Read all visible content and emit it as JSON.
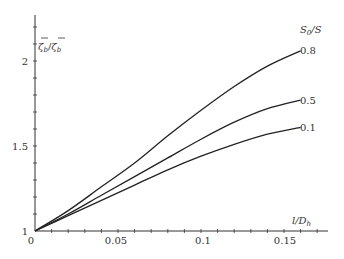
{
  "chart_data": {
    "type": "line",
    "title": "",
    "xlabel": "l/D_h",
    "ylabel": "ζ_b/ζ_b",
    "legend_title": "S_0/S",
    "xlim": [
      0,
      0.175
    ],
    "ylim": [
      1,
      2.25
    ],
    "x_ticks": [
      "0",
      "0.05",
      "0.1",
      "0.15"
    ],
    "y_ticks": [
      "1",
      "1.5",
      "2"
    ],
    "grid": false,
    "x": [
      0,
      0.02,
      0.04,
      0.06,
      0.08,
      0.1,
      0.12,
      0.14,
      0.16
    ],
    "series": [
      {
        "name": "0.8",
        "values": [
          1.0,
          1.12,
          1.26,
          1.4,
          1.56,
          1.71,
          1.85,
          1.97,
          2.06
        ]
      },
      {
        "name": "0.5",
        "values": [
          1.0,
          1.1,
          1.21,
          1.32,
          1.43,
          1.54,
          1.64,
          1.72,
          1.77
        ]
      },
      {
        "name": "0.1",
        "values": [
          1.0,
          1.09,
          1.18,
          1.27,
          1.36,
          1.44,
          1.51,
          1.57,
          1.61
        ]
      }
    ]
  },
  "labels": {
    "y_axis": "ζ̄b/ζ̄b",
    "x_axis": "l/Dh",
    "legend_title": "S0/S",
    "tick_0": "0",
    "tick_005": "0.05",
    "tick_01": "0.1",
    "tick_015": "0.15",
    "ytick_1": "1",
    "ytick_15": "1.5",
    "ytick_2": "2",
    "curve_08": "0.8",
    "curve_05": "0.5",
    "curve_01": "0.1"
  }
}
